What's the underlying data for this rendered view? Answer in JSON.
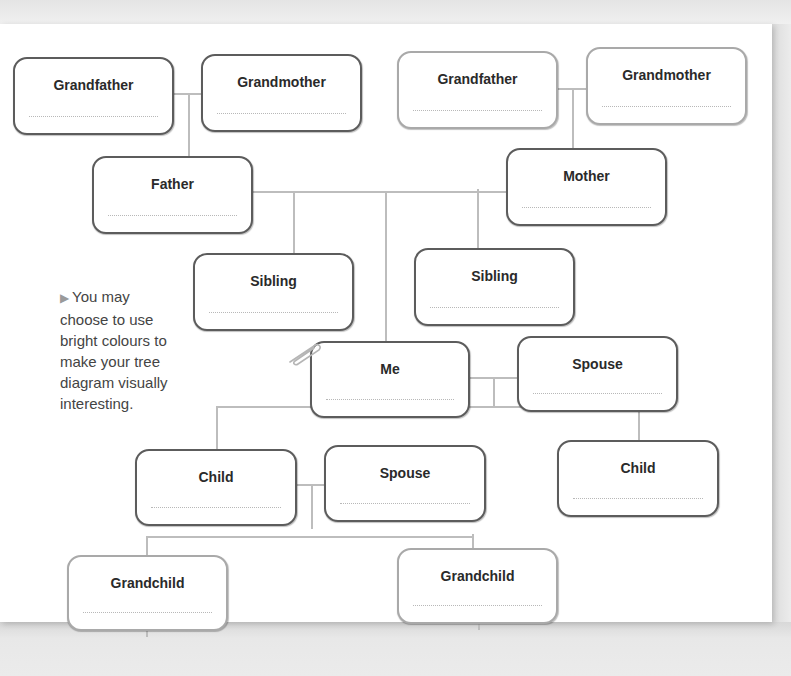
{
  "diagram": {
    "type": "family-tree-worksheet",
    "nodes": {
      "paternal_grandfather": {
        "label": "Grandfather",
        "value": ""
      },
      "paternal_grandmother": {
        "label": "Grandmother",
        "value": ""
      },
      "maternal_grandfather": {
        "label": "Grandfather",
        "value": ""
      },
      "maternal_grandmother": {
        "label": "Grandmother",
        "value": ""
      },
      "father": {
        "label": "Father",
        "value": ""
      },
      "mother": {
        "label": "Mother",
        "value": ""
      },
      "sibling_1": {
        "label": "Sibling",
        "value": ""
      },
      "sibling_2": {
        "label": "Sibling",
        "value": ""
      },
      "me": {
        "label": "Me",
        "value": ""
      },
      "spouse": {
        "label": "Spouse",
        "value": ""
      },
      "child_1": {
        "label": "Child",
        "value": ""
      },
      "child_1_spouse": {
        "label": "Spouse",
        "value": ""
      },
      "child_2": {
        "label": "Child",
        "value": ""
      },
      "grandchild_1": {
        "label": "Grandchild",
        "value": ""
      },
      "grandchild_2": {
        "label": "Grandchild",
        "value": ""
      }
    },
    "edges": [
      [
        "paternal_grandfather",
        "paternal_grandmother",
        "father"
      ],
      [
        "maternal_grandfather",
        "maternal_grandmother",
        "mother"
      ],
      [
        "father",
        "mother",
        "sibling_1"
      ],
      [
        "father",
        "mother",
        "sibling_2"
      ],
      [
        "father",
        "mother",
        "me"
      ],
      [
        "me",
        "spouse",
        "child_1"
      ],
      [
        "me",
        "spouse",
        "child_2"
      ],
      [
        "child_1",
        "child_1_spouse",
        "grandchild_1"
      ],
      [
        "child_1",
        "child_1_spouse",
        "grandchild_2"
      ]
    ]
  },
  "note": {
    "arrow_icon": "▶",
    "text": "You may choose to use bright colours to make your tree diagram visually interesting."
  },
  "colors": {
    "dark_border": "#5c5c5c",
    "light_border": "#a9a9a9",
    "connector": "#bdbdbd",
    "text": "#2a2a2a"
  }
}
